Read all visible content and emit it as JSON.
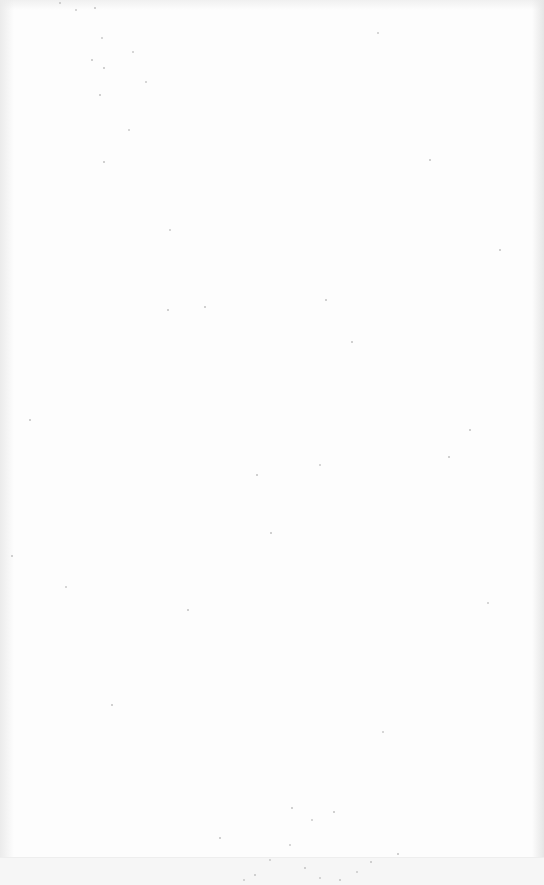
{
  "page": {
    "kind": "blank-scanned-page",
    "text": "",
    "colors": {
      "paper": "#fdfdfd",
      "edge_shadow_left": "#ebebeb",
      "edge_shadow_right": "#e6e6e6",
      "speckle": "#c8c8c8",
      "bottom_band": "#f6f6f6"
    },
    "speckles": [
      [
        76,
        10,
        2
      ],
      [
        95,
        8,
        1.5
      ],
      [
        60,
        3,
        1.5
      ],
      [
        102,
        38,
        2
      ],
      [
        92,
        60,
        1.5
      ],
      [
        133,
        52,
        2
      ],
      [
        104,
        68,
        1.5
      ],
      [
        146,
        82,
        2
      ],
      [
        100,
        95,
        1.5
      ],
      [
        129,
        130,
        2
      ],
      [
        104,
        162,
        1.5
      ],
      [
        170,
        230,
        2
      ],
      [
        378,
        33,
        2
      ],
      [
        205,
        307,
        1.5
      ],
      [
        168,
        310,
        1.5
      ],
      [
        326,
        300,
        1.5
      ],
      [
        352,
        342,
        1.5
      ],
      [
        320,
        465,
        2
      ],
      [
        257,
        475,
        1.5
      ],
      [
        271,
        533,
        1.5
      ],
      [
        449,
        457,
        1.5
      ],
      [
        488,
        603,
        2
      ],
      [
        12,
        556,
        1.5
      ],
      [
        66,
        587,
        2
      ],
      [
        112,
        705,
        1.5
      ],
      [
        383,
        732,
        2
      ],
      [
        292,
        808,
        1.5
      ],
      [
        312,
        820,
        2
      ],
      [
        334,
        812,
        1.5
      ],
      [
        290,
        845,
        2
      ],
      [
        270,
        860,
        2
      ],
      [
        305,
        868,
        1.5
      ],
      [
        320,
        878,
        2
      ],
      [
        340,
        880,
        1.5
      ],
      [
        357,
        872,
        2
      ],
      [
        371,
        862,
        1.5
      ],
      [
        255,
        875,
        1.5
      ],
      [
        244,
        880,
        2
      ],
      [
        398,
        854,
        1.5
      ],
      [
        220,
        838,
        1.5
      ],
      [
        470,
        430,
        1.5
      ],
      [
        500,
        250,
        1.5
      ],
      [
        30,
        420,
        1.5
      ],
      [
        188,
        610,
        1.5
      ],
      [
        430,
        160,
        1.5
      ]
    ]
  }
}
